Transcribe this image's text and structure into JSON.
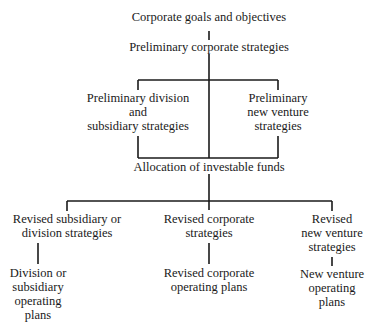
{
  "diagram": {
    "type": "strategic-planning-flowchart",
    "line_color": "#1a1a1a",
    "nodes": {
      "goals": {
        "lines": [
          "Corporate goals and objectives"
        ]
      },
      "prelim_corporate": {
        "lines": [
          "Preliminary corporate strategies"
        ]
      },
      "prelim_division": {
        "lines": [
          "Preliminary division",
          "and",
          "subsidiary strategies"
        ]
      },
      "prelim_venture": {
        "lines": [
          "Preliminary",
          "new venture",
          "strategies"
        ]
      },
      "allocation": {
        "lines": [
          "Allocation of investable funds"
        ]
      },
      "revised_subsidiary": {
        "lines": [
          "Revised subsidiary or",
          "division strategies"
        ]
      },
      "revised_corporate": {
        "lines": [
          "Revised corporate",
          "strategies"
        ]
      },
      "revised_venture": {
        "lines": [
          "Revised",
          "new venture",
          "strategies"
        ]
      },
      "division_plans": {
        "lines": [
          "Division or",
          "subsidiary",
          "operating",
          "plans"
        ]
      },
      "corporate_plans": {
        "lines": [
          "Revised corporate",
          "operating plans"
        ]
      },
      "venture_plans": {
        "lines": [
          "New venture",
          "operating",
          "plans"
        ]
      }
    },
    "edges": [
      [
        "goals",
        "prelim_corporate"
      ],
      [
        "prelim_corporate",
        "prelim_division"
      ],
      [
        "prelim_corporate",
        "prelim_venture"
      ],
      [
        "prelim_corporate",
        "allocation"
      ],
      [
        "prelim_division",
        "allocation"
      ],
      [
        "prelim_venture",
        "allocation"
      ],
      [
        "allocation",
        "revised_subsidiary"
      ],
      [
        "allocation",
        "revised_corporate"
      ],
      [
        "allocation",
        "revised_venture"
      ],
      [
        "revised_subsidiary",
        "division_plans"
      ],
      [
        "revised_corporate",
        "corporate_plans"
      ],
      [
        "revised_venture",
        "venture_plans"
      ]
    ]
  }
}
